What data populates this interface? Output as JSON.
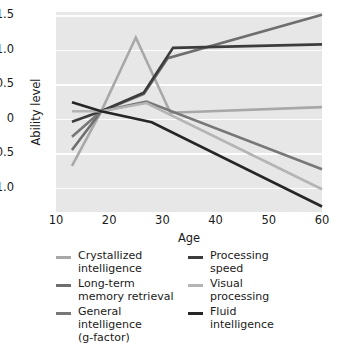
{
  "chart_data": {
    "type": "line",
    "title": "",
    "xlabel": "Age",
    "ylabel": "Ability level",
    "xlim": [
      10,
      60
    ],
    "ylim": [
      -1.35,
      1.55
    ],
    "xticks": [
      10,
      20,
      30,
      40,
      50,
      60
    ],
    "yticks": [
      "1.5",
      "1.0",
      "0.5",
      "0",
      "-0.5",
      "-1.0"
    ],
    "ytick_values": [
      1.5,
      1.0,
      0.5,
      0.0,
      -0.5,
      -1.0
    ],
    "grid": "horizontal-white",
    "legend_position": "below",
    "series": [
      {
        "name": "Crystallized intelligence",
        "color": "#a8a8a8",
        "x": [
          13,
          18.5,
          25,
          31.5,
          60
        ],
        "values": [
          -0.68,
          0.11,
          1.18,
          0.09,
          0.17
        ]
      },
      {
        "name": "Long-term memory retrieval",
        "color": "#6e6e6e",
        "x": [
          13,
          18.5,
          26.5,
          31,
          60
        ],
        "values": [
          -0.45,
          0.11,
          0.36,
          0.88,
          1.51
        ]
      },
      {
        "name": "General intelligence (g-factor)",
        "color": "#777777",
        "x": [
          13,
          18.5,
          27,
          60
        ],
        "values": [
          -0.26,
          0.11,
          0.25,
          -0.73
        ]
      },
      {
        "name": "Processing speed",
        "color": "#3c3c3c",
        "x": [
          13,
          18.5,
          26.5,
          32,
          38,
          60
        ],
        "values": [
          -0.04,
          0.11,
          0.38,
          1.03,
          1.04,
          1.08
        ]
      },
      {
        "name": "Visual processing",
        "color": "#b4b4b4",
        "x": [
          13,
          18.5,
          27,
          60
        ],
        "values": [
          0.11,
          0.11,
          0.23,
          -1.02
        ]
      },
      {
        "name": "Fluid intelligence",
        "color": "#262626",
        "x": [
          13,
          18.5,
          28,
          60
        ],
        "values": [
          0.24,
          0.11,
          -0.05,
          -1.27
        ]
      }
    ]
  },
  "axes": {
    "ylabel": "Ability level",
    "xlabel": "Age",
    "ytick_labels": [
      "1.5",
      "1.0",
      "0.5",
      "0",
      "-0.5",
      "-1.0"
    ],
    "xtick_labels": [
      "10",
      "20",
      "30",
      "40",
      "50",
      "60"
    ]
  },
  "legend": {
    "left_column": [
      {
        "label": "Crystallized\nintelligence",
        "color": "#a8a8a8"
      },
      {
        "label": "Long-term\nmemory retrieval",
        "color": "#6e6e6e"
      },
      {
        "label": "General\nintelligence\n(g-factor)",
        "color": "#777777"
      }
    ],
    "right_column": [
      {
        "label": "Processing\nspeed",
        "color": "#3c3c3c"
      },
      {
        "label": "Visual\nprocessing",
        "color": "#b4b4b4"
      },
      {
        "label": "Fluid\nintelligence",
        "color": "#262626"
      }
    ]
  },
  "colors": {
    "plot_background": "#e7e7e7",
    "gridline": "#fdfdfd",
    "page_background": "#ffffff",
    "text": "#1a1a1a"
  }
}
